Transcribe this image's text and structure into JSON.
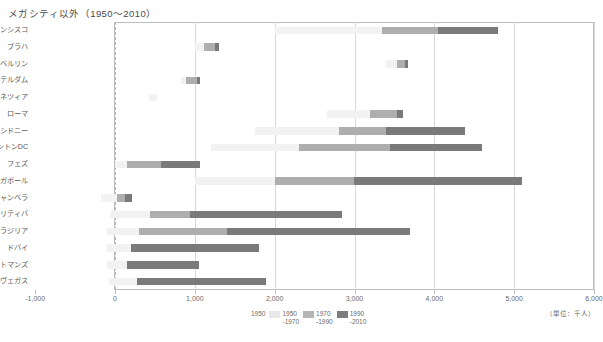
{
  "title": "メガシティ以外（1950〜2010）",
  "axis": {
    "unit_label": "（単位：千人）",
    "ticks": [
      {
        "value": -1000,
        "label": "-1,000"
      },
      {
        "value": 0,
        "label": "0"
      },
      {
        "value": 1000,
        "label": "1,000"
      },
      {
        "value": 2000,
        "label": "2,000"
      },
      {
        "value": 3000,
        "label": "3,000"
      },
      {
        "value": 4000,
        "label": "4,000"
      },
      {
        "value": 5000,
        "label": "5,000"
      },
      {
        "value": 6000,
        "label": "6,000"
      }
    ]
  },
  "legend": {
    "items": [
      {
        "label_1": "1950",
        "label_2": "",
        "color": "#ffffff"
      },
      {
        "label_1": "1950",
        "label_2": "-1970",
        "color": "#e8e8e8"
      },
      {
        "label_1": "1970",
        "label_2": "-1990",
        "color": "#b5b5b5"
      },
      {
        "label_1": "1990",
        "label_2": "-2010",
        "color": "#7d7d7d"
      }
    ]
  },
  "colors": {
    "base_1950": "#f2f2f2",
    "growth_1950_1970": "#e0e0e0",
    "growth_1970_1990": "#aeaeae",
    "growth_1990_2010": "#7a7a7a",
    "gridline": "#d8d8d8",
    "zeroline": "#c9b97a",
    "frame": "#bdbdbd"
  },
  "categories": [
    {
      "num": "①",
      "name": "成熟型",
      "row_start": 0,
      "row_count": 6
    },
    {
      "num": "②",
      "name": "人口減少型",
      "row_start": 6,
      "row_count": 2
    },
    {
      "num": "③",
      "name": "近年成長型",
      "row_start": 8,
      "row_count": 3
    },
    {
      "num": "④",
      "name": "加速成長型",
      "row_start": 11,
      "row_count": 5
    }
  ],
  "chart_data": {
    "type": "bar",
    "orientation": "horizontal",
    "stacked": true,
    "title": "メガシティ以外（1950〜2010）",
    "xlabel": "",
    "ylabel": "",
    "xlim": [
      -1000,
      6000
    ],
    "unit": "千人",
    "grid": true,
    "legend_position": "bottom",
    "series": [
      {
        "name": "1950",
        "color": "#f2f2f2"
      },
      {
        "name": "1950-1970",
        "color": "#e0e0e0"
      },
      {
        "name": "1970-1990",
        "color": "#aeaeae"
      },
      {
        "name": "1990-2010",
        "color": "#7a7a7a"
      }
    ],
    "categories": [
      "サンフランシスコ",
      "プラハ",
      "ベルリン",
      "アムステルダム",
      "ヴェネツィア",
      "ローマ",
      "シドニー",
      "ワシントンDC",
      "フェズ",
      "シンガポール",
      "キャンベラ",
      "クリティバ",
      "ブラジリア",
      "ドバイ",
      "カトマンズ",
      "ラスヴェガス"
    ],
    "rows": [
      {
        "city": "サンフランシスコ",
        "start": 2000,
        "segments": [
          {
            "series": "1950",
            "value": 1350
          },
          {
            "series": "1950-1970",
            "value": 0
          },
          {
            "series": "1970-1990",
            "value": 700
          },
          {
            "series": "1990-2010",
            "value": 750
          }
        ],
        "end": 4800
      },
      {
        "city": "プラハ",
        "start": 1000,
        "segments": [
          {
            "series": "1950",
            "value": 120
          },
          {
            "series": "1950-1970",
            "value": 0
          },
          {
            "series": "1970-1990",
            "value": 130
          },
          {
            "series": "1990-2010",
            "value": 50
          }
        ],
        "end": 1300
      },
      {
        "city": "ベルリン",
        "start": 3400,
        "segments": [
          {
            "series": "1950",
            "value": 130
          },
          {
            "series": "1950-1970",
            "value": 0
          },
          {
            "series": "1970-1990",
            "value": 100
          },
          {
            "series": "1990-2010",
            "value": 40
          }
        ],
        "end": 3670
      },
      {
        "city": "アムステルダム",
        "start": 830,
        "segments": [
          {
            "series": "1950",
            "value": 60
          },
          {
            "series": "1950-1970",
            "value": 0
          },
          {
            "series": "1970-1990",
            "value": 140
          },
          {
            "series": "1990-2010",
            "value": 40
          }
        ],
        "end": 1070
      },
      {
        "city": "ヴェネツィア",
        "start": 420,
        "segments": [
          {
            "series": "1950",
            "value": 110
          },
          {
            "series": "1950-1970",
            "value": 0
          },
          {
            "series": "1970-1990",
            "value": 0
          },
          {
            "series": "1990-2010",
            "value": 0
          }
        ],
        "end": 530
      },
      {
        "city": "ローマ",
        "start": 2650,
        "segments": [
          {
            "series": "1950",
            "value": 540
          },
          {
            "series": "1950-1970",
            "value": 0
          },
          {
            "series": "1970-1990",
            "value": 340
          },
          {
            "series": "1990-2010",
            "value": 80
          }
        ],
        "end": 3610
      },
      {
        "city": "シドニー",
        "start": 1750,
        "segments": [
          {
            "series": "1950",
            "value": 1060
          },
          {
            "series": "1950-1970",
            "value": 0
          },
          {
            "series": "1970-1990",
            "value": 590
          },
          {
            "series": "1990-2010",
            "value": 980
          }
        ],
        "end": 4380
      },
      {
        "city": "ワシントンDC",
        "start": 1200,
        "segments": [
          {
            "series": "1950",
            "value": 1100
          },
          {
            "series": "1950-1970",
            "value": 0
          },
          {
            "series": "1970-1990",
            "value": 1150
          },
          {
            "series": "1990-2010",
            "value": 1150
          }
        ],
        "end": 4600
      },
      {
        "city": "フェズ",
        "start": 0,
        "segments": [
          {
            "series": "1950",
            "value": 150
          },
          {
            "series": "1950-1970",
            "value": 0
          },
          {
            "series": "1970-1990",
            "value": 430
          },
          {
            "series": "1990-2010",
            "value": 480
          }
        ],
        "end": 1060
      },
      {
        "city": "シンガポール",
        "start": 1000,
        "segments": [
          {
            "series": "1950",
            "value": 1000
          },
          {
            "series": "1950-1970",
            "value": 0
          },
          {
            "series": "1970-1990",
            "value": 1000
          },
          {
            "series": "1990-2010",
            "value": 2100
          }
        ],
        "end": 5100
      },
      {
        "city": "キャンベラ",
        "start": -180,
        "segments": [
          {
            "series": "1950",
            "value": 200
          },
          {
            "series": "1950-1970",
            "value": 0
          },
          {
            "series": "1970-1990",
            "value": 100
          },
          {
            "series": "1990-2010",
            "value": 90
          }
        ],
        "end": 210
      },
      {
        "city": "クリティバ",
        "start": -60,
        "segments": [
          {
            "series": "1950",
            "value": 500
          },
          {
            "series": "1950-1970",
            "value": 0
          },
          {
            "series": "1970-1990",
            "value": 500
          },
          {
            "series": "1990-2010",
            "value": 1900
          }
        ],
        "end": 2840
      },
      {
        "city": "ブラジリア",
        "start": -100,
        "segments": [
          {
            "series": "1950",
            "value": 400
          },
          {
            "series": "1950-1970",
            "value": 0
          },
          {
            "series": "1970-1990",
            "value": 1100
          },
          {
            "series": "1990-2010",
            "value": 2300
          }
        ],
        "end": 3700
      },
      {
        "city": "ドバイ",
        "start": -100,
        "segments": [
          {
            "series": "1950",
            "value": 300
          },
          {
            "series": "1950-1970",
            "value": 0
          },
          {
            "series": "1970-1990",
            "value": 0
          },
          {
            "series": "1990-2010",
            "value": 1600
          }
        ],
        "end": 1800
      },
      {
        "city": "カトマンズ",
        "start": -100,
        "segments": [
          {
            "series": "1950",
            "value": 250
          },
          {
            "series": "1950-1970",
            "value": 0
          },
          {
            "series": "1970-1990",
            "value": 0
          },
          {
            "series": "1990-2010",
            "value": 900
          }
        ],
        "end": 1050
      },
      {
        "city": "ラスヴェガス",
        "start": -80,
        "segments": [
          {
            "series": "1950",
            "value": 350
          },
          {
            "series": "1950-1970",
            "value": 0
          },
          {
            "series": "1970-1990",
            "value": 0
          },
          {
            "series": "1990-2010",
            "value": 1620
          }
        ],
        "end": 1890
      }
    ]
  }
}
